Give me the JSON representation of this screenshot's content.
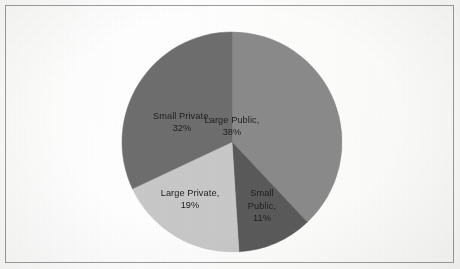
{
  "document": {
    "background_color": "#fdfdfd",
    "frame_color": "#9b9b9b"
  },
  "chart_data": {
    "type": "pie",
    "title": "",
    "subtitle": "",
    "xlabel": "",
    "ylabel": "",
    "legend_position": "none",
    "grid": false,
    "labels_inside_slices": true,
    "start_angle_deg": 0,
    "direction": "clockwise",
    "categories": [
      "Large Public",
      "Small Public",
      "Large Private",
      "Small Private"
    ],
    "values": [
      38,
      11,
      19,
      32
    ],
    "units": "percent",
    "total": 100,
    "colors": [
      "#8a8a8a",
      "#5a5a5a",
      "#c8c8c8",
      "#6e6e6e"
    ],
    "slices": [
      {
        "name": "Large Public",
        "value": 38,
        "value_text": "38%",
        "label_line1": "Large Public,",
        "label_line2": "38%",
        "label_line3": "",
        "color": "#8a8a8a",
        "start_deg": 0,
        "end_deg": 136.8
      },
      {
        "name": "Small Public",
        "value": 11,
        "value_text": "11%",
        "label_line1": "Small",
        "label_line2": "Public,",
        "label_line3": "11%",
        "color": "#5a5a5a",
        "start_deg": 136.8,
        "end_deg": 176.4
      },
      {
        "name": "Large Private",
        "value": 19,
        "value_text": "19%",
        "label_line1": "Large Private,",
        "label_line2": "19%",
        "label_line3": "",
        "color": "#c8c8c8",
        "start_deg": 176.4,
        "end_deg": 244.8
      },
      {
        "name": "Small Private",
        "value": 32,
        "value_text": "32%",
        "label_line1": "Small Private,",
        "label_line2": "32%",
        "label_line3": "",
        "color": "#6e6e6e",
        "start_deg": 244.8,
        "end_deg": 360
      }
    ],
    "geometry": {
      "center_x": 232,
      "center_y": 142,
      "radius": 110
    }
  }
}
